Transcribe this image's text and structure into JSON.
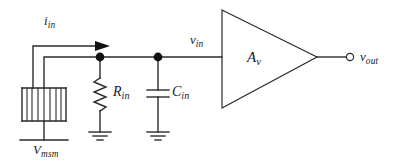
{
  "figure": {
    "name": "msm-photodetector-input-equivalent-circuit",
    "background_color": "#ffffff",
    "line_color": "#2b2b2b",
    "text_color": "#1a1a1a"
  },
  "labels": {
    "input_current": {
      "base": "i",
      "sub": "in",
      "full": "i_in"
    },
    "msm_bias": {
      "base": "V",
      "sub": "msm",
      "full": "V_msm"
    },
    "input_resistance": {
      "base": "R",
      "sub": "in",
      "full": "R_in"
    },
    "input_capacitance": {
      "base": "C",
      "sub": "in",
      "full": "C_in"
    },
    "input_voltage": {
      "base": "v",
      "sub": "in",
      "full": "v_in"
    },
    "amplifier_gain": {
      "base": "A",
      "sub": "v",
      "full": "A_v"
    },
    "output_voltage": {
      "base": "v",
      "sub": "out",
      "full": "v_out"
    }
  },
  "components": [
    {
      "id": "msm-detector",
      "type": "msm-photodetector",
      "label": "V_msm",
      "finger_count": 7
    },
    {
      "id": "input-resistor",
      "type": "resistor",
      "label": "R_in"
    },
    {
      "id": "input-capacitor",
      "type": "capacitor",
      "label": "C_in"
    },
    {
      "id": "voltage-amplifier",
      "type": "triangle-amplifier",
      "label": "A_v"
    }
  ],
  "nodes": [
    {
      "id": "node-resistor",
      "x": 100,
      "y": 57
    },
    {
      "id": "node-capacitor",
      "x": 158,
      "y": 57
    }
  ],
  "terminals": [
    {
      "id": "output-terminal",
      "type": "open-circle",
      "label": "v_out",
      "x": 351,
      "y": 57
    }
  ],
  "grounds": [
    {
      "id": "ground-resistor",
      "x": 100,
      "y": 137
    },
    {
      "id": "ground-capacitor",
      "x": 158,
      "y": 137
    }
  ],
  "annotations": [
    {
      "id": "current-arrow",
      "label": "i_in",
      "direction": "right"
    }
  ]
}
